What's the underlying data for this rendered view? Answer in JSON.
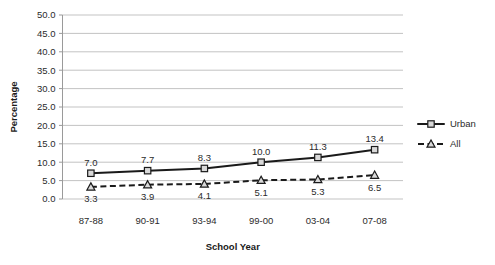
{
  "chart_data": {
    "type": "line",
    "title": "",
    "xlabel": "School Year",
    "ylabel": "Percentage",
    "categories": [
      "87-88",
      "90-91",
      "93-94",
      "99-00",
      "03-04",
      "07-08"
    ],
    "ylim": [
      0.0,
      50.0
    ],
    "ytick_step": 5.0,
    "ytick_labels": [
      "50.0",
      "45.0",
      "40.0",
      "35.0",
      "30.0",
      "25.0",
      "20.0",
      "15.0",
      "10.0",
      "5.0",
      "0.0"
    ],
    "grid": true,
    "legend_position": "right",
    "series": [
      {
        "name": "Urban",
        "values": [
          7.0,
          7.7,
          8.3,
          10.0,
          11.3,
          13.4
        ],
        "labels": [
          "7.0",
          "7.7",
          "8.3",
          "10.0",
          "11.3",
          "13.4"
        ],
        "line_style": "solid",
        "marker": "square",
        "label_position": "above",
        "color": "#1a1a1a"
      },
      {
        "name": "All",
        "values": [
          3.3,
          3.9,
          4.1,
          5.1,
          5.3,
          6.5
        ],
        "labels": [
          "3.3",
          "3.9",
          "4.1",
          "5.1",
          "5.3",
          "6.5"
        ],
        "line_style": "dashed",
        "marker": "triangle",
        "label_position": "below",
        "color": "#1a1a1a"
      }
    ]
  },
  "legend": {
    "items": [
      {
        "label": "Urban",
        "marker": "square",
        "line_style": "solid"
      },
      {
        "label": "All",
        "marker": "triangle",
        "line_style": "dashed"
      }
    ]
  }
}
